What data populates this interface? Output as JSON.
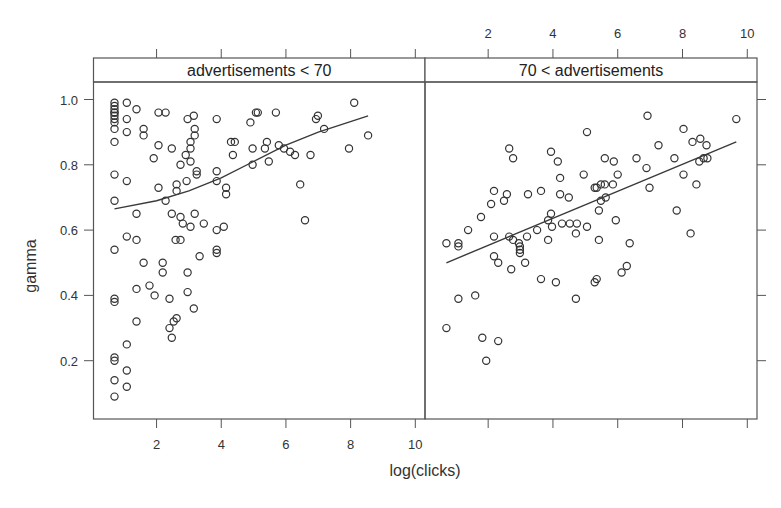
{
  "chart_data": {
    "type": "scatter",
    "layout": "trellis-1x2",
    "xlabel": "log(clicks)",
    "ylabel": "gamma",
    "xlim": [
      0.05,
      10.3
    ],
    "ylim": [
      0.02,
      1.08
    ],
    "x_ticks": [
      2,
      4,
      6,
      8,
      10
    ],
    "y_ticks": [
      0.2,
      0.4,
      0.6,
      0.8,
      1.0
    ],
    "y_tick_labels": [
      "0.2",
      "0.4",
      "0.6",
      "0.8",
      "1.0"
    ],
    "x_tick_labels": [
      "2",
      "4",
      "6",
      "8",
      "10"
    ],
    "grid": false,
    "legend": null,
    "marker": "open-circle",
    "colors": {
      "points": "#333333",
      "line": "#3a3a3a",
      "frame": "#555555",
      "strip_bg": "#ffffff"
    },
    "panels": [
      {
        "strip": "advertisements < 70",
        "fit_line": {
          "type": "loess",
          "x": [
            0.7,
            2.0,
            3.0,
            4.0,
            5.0,
            6.0,
            7.0,
            8.54
          ],
          "y": [
            0.665,
            0.69,
            0.72,
            0.76,
            0.81,
            0.86,
            0.9,
            0.95
          ]
        },
        "points": [
          [
            0.7,
            0.99
          ],
          [
            0.7,
            0.98
          ],
          [
            0.7,
            0.97
          ],
          [
            0.7,
            0.96
          ],
          [
            0.7,
            0.96
          ],
          [
            0.7,
            0.95
          ],
          [
            0.7,
            0.94
          ],
          [
            0.7,
            0.93
          ],
          [
            0.7,
            0.91
          ],
          [
            0.7,
            0.87
          ],
          [
            0.7,
            0.77
          ],
          [
            0.7,
            0.69
          ],
          [
            0.7,
            0.54
          ],
          [
            0.7,
            0.39
          ],
          [
            0.7,
            0.38
          ],
          [
            0.7,
            0.21
          ],
          [
            0.7,
            0.2
          ],
          [
            0.7,
            0.14
          ],
          [
            0.7,
            0.09
          ],
          [
            1.08,
            0.99
          ],
          [
            1.08,
            0.94
          ],
          [
            1.08,
            0.9
          ],
          [
            1.08,
            0.75
          ],
          [
            1.08,
            0.58
          ],
          [
            1.08,
            0.25
          ],
          [
            1.08,
            0.17
          ],
          [
            1.08,
            0.12
          ],
          [
            1.38,
            0.97
          ],
          [
            1.38,
            0.65
          ],
          [
            1.38,
            0.57
          ],
          [
            1.38,
            0.42
          ],
          [
            1.38,
            0.32
          ],
          [
            1.6,
            0.91
          ],
          [
            1.6,
            0.89
          ],
          [
            1.6,
            0.5
          ],
          [
            1.78,
            0.43
          ],
          [
            1.91,
            0.82
          ],
          [
            1.94,
            0.4
          ],
          [
            2.06,
            0.96
          ],
          [
            2.06,
            0.86
          ],
          [
            2.06,
            0.73
          ],
          [
            2.19,
            0.5
          ],
          [
            2.19,
            0.47
          ],
          [
            2.28,
            0.96
          ],
          [
            2.28,
            0.69
          ],
          [
            2.4,
            0.39
          ],
          [
            2.4,
            0.3
          ],
          [
            2.47,
            0.85
          ],
          [
            2.47,
            0.65
          ],
          [
            2.47,
            0.27
          ],
          [
            2.53,
            0.32
          ],
          [
            2.59,
            0.57
          ],
          [
            2.62,
            0.74
          ],
          [
            2.62,
            0.72
          ],
          [
            2.62,
            0.33
          ],
          [
            2.74,
            0.8
          ],
          [
            2.74,
            0.64
          ],
          [
            2.74,
            0.57
          ],
          [
            2.81,
            0.62
          ],
          [
            2.9,
            0.83
          ],
          [
            2.93,
            0.75
          ],
          [
            2.96,
            0.94
          ],
          [
            2.96,
            0.47
          ],
          [
            2.96,
            0.41
          ],
          [
            3.05,
            0.87
          ],
          [
            3.05,
            0.85
          ],
          [
            3.05,
            0.81
          ],
          [
            3.05,
            0.61
          ],
          [
            3.15,
            0.95
          ],
          [
            3.15,
            0.36
          ],
          [
            3.18,
            0.91
          ],
          [
            3.18,
            0.89
          ],
          [
            3.18,
            0.65
          ],
          [
            3.24,
            0.78
          ],
          [
            3.24,
            0.77
          ],
          [
            3.33,
            0.52
          ],
          [
            3.46,
            0.62
          ],
          [
            3.86,
            0.94
          ],
          [
            3.86,
            0.78
          ],
          [
            3.86,
            0.75
          ],
          [
            3.86,
            0.6
          ],
          [
            3.86,
            0.54
          ],
          [
            3.86,
            0.53
          ],
          [
            4.08,
            0.61
          ],
          [
            4.15,
            0.73
          ],
          [
            4.15,
            0.71
          ],
          [
            4.3,
            0.87
          ],
          [
            4.36,
            0.83
          ],
          [
            4.42,
            0.87
          ],
          [
            4.9,
            0.93
          ],
          [
            4.97,
            0.85
          ],
          [
            4.97,
            0.8
          ],
          [
            5.07,
            0.96
          ],
          [
            5.13,
            0.96
          ],
          [
            5.35,
            0.85
          ],
          [
            5.41,
            0.87
          ],
          [
            5.47,
            0.81
          ],
          [
            5.69,
            0.96
          ],
          [
            5.78,
            0.86
          ],
          [
            5.94,
            0.85
          ],
          [
            6.13,
            0.84
          ],
          [
            6.28,
            0.83
          ],
          [
            6.44,
            0.74
          ],
          [
            6.59,
            0.63
          ],
          [
            6.76,
            0.83
          ],
          [
            6.93,
            0.94
          ],
          [
            6.99,
            0.95
          ],
          [
            7.18,
            0.91
          ],
          [
            7.95,
            0.85
          ],
          [
            8.11,
            0.99
          ],
          [
            8.54,
            0.89
          ]
        ]
      },
      {
        "strip": "70 < advertisements",
        "fit_line": {
          "type": "linear",
          "x": [
            0.71,
            9.66
          ],
          "y": [
            0.5,
            0.87
          ]
        },
        "points": [
          [
            0.71,
            0.56
          ],
          [
            0.71,
            0.3
          ],
          [
            1.08,
            0.56
          ],
          [
            1.08,
            0.55
          ],
          [
            1.08,
            0.39
          ],
          [
            1.38,
            0.6
          ],
          [
            1.6,
            0.4
          ],
          [
            1.78,
            0.64
          ],
          [
            1.82,
            0.27
          ],
          [
            1.94,
            0.2
          ],
          [
            2.09,
            0.68
          ],
          [
            2.18,
            0.72
          ],
          [
            2.18,
            0.58
          ],
          [
            2.18,
            0.52
          ],
          [
            2.31,
            0.5
          ],
          [
            2.31,
            0.26
          ],
          [
            2.49,
            0.69
          ],
          [
            2.58,
            0.71
          ],
          [
            2.65,
            0.85
          ],
          [
            2.65,
            0.58
          ],
          [
            2.71,
            0.48
          ],
          [
            2.77,
            0.82
          ],
          [
            2.77,
            0.57
          ],
          [
            2.95,
            0.56
          ],
          [
            2.98,
            0.55
          ],
          [
            2.98,
            0.54
          ],
          [
            2.98,
            0.53
          ],
          [
            3.14,
            0.5
          ],
          [
            3.2,
            0.58
          ],
          [
            3.23,
            0.71
          ],
          [
            3.51,
            0.6
          ],
          [
            3.63,
            0.72
          ],
          [
            3.63,
            0.45
          ],
          [
            3.85,
            0.63
          ],
          [
            3.85,
            0.57
          ],
          [
            3.94,
            0.84
          ],
          [
            3.94,
            0.65
          ],
          [
            3.97,
            0.61
          ],
          [
            4.09,
            0.44
          ],
          [
            4.15,
            0.81
          ],
          [
            4.22,
            0.76
          ],
          [
            4.22,
            0.71
          ],
          [
            4.28,
            0.62
          ],
          [
            4.49,
            0.7
          ],
          [
            4.52,
            0.62
          ],
          [
            4.71,
            0.59
          ],
          [
            4.71,
            0.39
          ],
          [
            4.74,
            0.62
          ],
          [
            4.95,
            0.77
          ],
          [
            5.05,
            0.9
          ],
          [
            5.05,
            0.61
          ],
          [
            5.29,
            0.73
          ],
          [
            5.29,
            0.44
          ],
          [
            5.35,
            0.73
          ],
          [
            5.35,
            0.45
          ],
          [
            5.42,
            0.66
          ],
          [
            5.42,
            0.57
          ],
          [
            5.48,
            0.74
          ],
          [
            5.48,
            0.69
          ],
          [
            5.6,
            0.82
          ],
          [
            5.6,
            0.74
          ],
          [
            5.63,
            0.7
          ],
          [
            5.85,
            0.74
          ],
          [
            5.88,
            0.81
          ],
          [
            5.94,
            0.63
          ],
          [
            6.0,
            0.77
          ],
          [
            6.12,
            0.47
          ],
          [
            6.28,
            0.49
          ],
          [
            6.37,
            0.56
          ],
          [
            6.58,
            0.82
          ],
          [
            6.89,
            0.79
          ],
          [
            6.92,
            0.95
          ],
          [
            6.98,
            0.73
          ],
          [
            7.26,
            0.86
          ],
          [
            7.75,
            0.82
          ],
          [
            7.82,
            0.66
          ],
          [
            8.03,
            0.91
          ],
          [
            8.03,
            0.77
          ],
          [
            8.25,
            0.59
          ],
          [
            8.31,
            0.87
          ],
          [
            8.43,
            0.74
          ],
          [
            8.52,
            0.81
          ],
          [
            8.55,
            0.88
          ],
          [
            8.65,
            0.82
          ],
          [
            8.74,
            0.86
          ],
          [
            8.77,
            0.82
          ],
          [
            9.66,
            0.94
          ]
        ]
      }
    ]
  }
}
